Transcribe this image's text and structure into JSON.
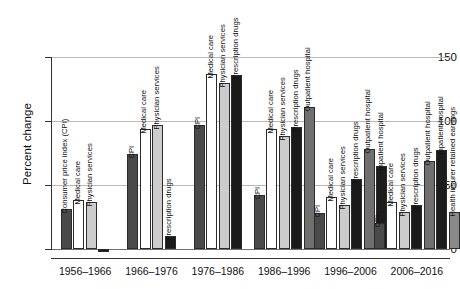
{
  "chart_data": {
    "type": "bar",
    "title": "",
    "xlabel": "",
    "ylabel": "Percent change",
    "ylim": [
      -5,
      150
    ],
    "yticks": [
      0,
      50,
      100,
      150
    ],
    "ytick_labels": [
      "0",
      "50",
      "100",
      "150"
    ],
    "grid": true,
    "legend": "in-plot rotated labels above each bar",
    "categories": [
      "1956–1966",
      "1966–1976",
      "1976–1986",
      "1986–1996",
      "1996–2006",
      "2006–2016"
    ],
    "series": [
      {
        "name": "Consumer price index (CPI)",
        "short_name": "CPI",
        "color": "#4a4a4a",
        "values": [
          31,
          74,
          97,
          42,
          28,
          20
        ]
      },
      {
        "name": "Medical care",
        "short_name": "Medical care",
        "color": "#ffffff",
        "values": [
          38,
          94,
          137,
          94,
          41,
          37
        ]
      },
      {
        "name": "Physician services",
        "short_name": "Physician services",
        "color": "#cccccc",
        "values": [
          37,
          97,
          130,
          88,
          34,
          29
        ]
      },
      {
        "name": "Prescription drugs",
        "short_name": "Prescription drugs",
        "color": "#1a1a1a",
        "values": [
          -2,
          10,
          136,
          95,
          55,
          34
        ]
      },
      {
        "name": "Outpatient hospital",
        "short_name": "Outpatient hospital",
        "color": "#707070",
        "values": [
          null,
          null,
          null,
          111,
          78,
          69
        ]
      },
      {
        "name": "Inpatient hospital",
        "short_name": "Inpatient hospital",
        "color": "#1c1c1c",
        "values": [
          null,
          null,
          null,
          null,
          65,
          77
        ]
      },
      {
        "name": "Health insurer retained earnings",
        "short_name": "Health insurer retained earnings",
        "color": "#8a8a8a",
        "values": [
          null,
          null,
          null,
          null,
          null,
          29
        ]
      }
    ],
    "groups": [
      {
        "category": "1956–1966",
        "bars": [
          {
            "label": "Consumer price index (CPI)",
            "value": 31,
            "color_class": "c-cpi"
          },
          {
            "label": "Medical care",
            "value": 38,
            "color_class": "c-med"
          },
          {
            "label": "Physician services",
            "value": 37,
            "color_class": "c-phys"
          },
          {
            "label": "",
            "value": -2,
            "color_class": "c-drug"
          }
        ]
      },
      {
        "category": "1966–1976",
        "bars": [
          {
            "label": "CPI",
            "value": 74,
            "color_class": "c-cpi"
          },
          {
            "label": "Medical care",
            "value": 94,
            "color_class": "c-med"
          },
          {
            "label": "Physician services",
            "value": 97,
            "color_class": "c-phys"
          },
          {
            "label": "Prescription drugs",
            "value": 10,
            "color_class": "c-drug"
          }
        ]
      },
      {
        "category": "1976–1986",
        "bars": [
          {
            "label": "CPI",
            "value": 97,
            "color_class": "c-cpi"
          },
          {
            "label": "Medical care",
            "value": 137,
            "color_class": "c-med"
          },
          {
            "label": "Physician services",
            "value": 130,
            "color_class": "c-phys"
          },
          {
            "label": "Prescription drugs",
            "value": 136,
            "color_class": "c-drug"
          }
        ]
      },
      {
        "category": "1986–1996",
        "bars": [
          {
            "label": "CPI",
            "value": 42,
            "color_class": "c-cpi"
          },
          {
            "label": "Medical care",
            "value": 94,
            "color_class": "c-med"
          },
          {
            "label": "Physician services",
            "value": 88,
            "color_class": "c-phys"
          },
          {
            "label": "Prescription drugs",
            "value": 95,
            "color_class": "c-drug"
          },
          {
            "label": "Outpatient hospital",
            "value": 111,
            "color_class": "c-outpt"
          }
        ]
      },
      {
        "category": "1996–2006",
        "bars": [
          {
            "label": "CPI",
            "value": 28,
            "color_class": "c-cpi"
          },
          {
            "label": "Medical care",
            "value": 41,
            "color_class": "c-med"
          },
          {
            "label": "Physician services",
            "value": 34,
            "color_class": "c-phys"
          },
          {
            "label": "Prescription drugs",
            "value": 55,
            "color_class": "c-drug"
          },
          {
            "label": "Outpatient hospital",
            "value": 78,
            "color_class": "c-outpt"
          },
          {
            "label": "Inpatient hospital",
            "value": 65,
            "color_class": "c-inpt"
          }
        ]
      },
      {
        "category": "2006–2016",
        "bars": [
          {
            "label": "CPI",
            "value": 20,
            "color_class": "c-cpi"
          },
          {
            "label": "Medical care",
            "value": 37,
            "color_class": "c-med"
          },
          {
            "label": "Physician services",
            "value": 29,
            "color_class": "c-phys"
          },
          {
            "label": "Prescription drugs",
            "value": 34,
            "color_class": "c-drug"
          },
          {
            "label": "Outpatient hospital",
            "value": 69,
            "color_class": "c-outpt"
          },
          {
            "label": "Inpatient hospital",
            "value": 77,
            "color_class": "c-inpt"
          },
          {
            "label": "Health insurer retained earnings",
            "value": 29,
            "color_class": "c-insurer"
          }
        ]
      }
    ]
  }
}
